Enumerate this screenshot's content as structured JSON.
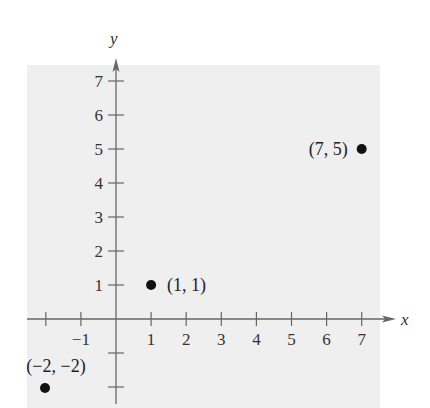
{
  "chart_data": {
    "type": "scatter",
    "title": "",
    "xlabel": "x",
    "ylabel": "y",
    "xlim": [
      -2.1,
      7.5
    ],
    "ylim": [
      -2.5,
      7.5
    ],
    "grid": false,
    "x_ticks": [
      -2,
      -1,
      1,
      2,
      3,
      4,
      5,
      6,
      7
    ],
    "x_tick_labels": [
      "",
      "−1",
      "1",
      "2",
      "3",
      "4",
      "5",
      "6",
      "7"
    ],
    "y_ticks": [
      -2,
      -1,
      1,
      2,
      3,
      4,
      5,
      6,
      7
    ],
    "y_tick_labels": [
      "",
      "",
      "1",
      "2",
      "3",
      "4",
      "5",
      "6",
      "7"
    ],
    "points": [
      {
        "x": -2,
        "y": -2,
        "label": "(−2, −2)"
      },
      {
        "x": 1,
        "y": 1,
        "label": "(1, 1)"
      },
      {
        "x": 7,
        "y": 5,
        "label": "(7, 5)"
      }
    ]
  },
  "colors": {
    "background": "#efefef",
    "axis": "#666666",
    "point": "#111111"
  }
}
